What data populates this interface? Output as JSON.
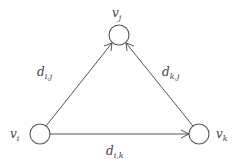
{
  "diagram": {
    "type": "directed-graph",
    "nodes": [
      {
        "id": "vi",
        "main": "v",
        "sub": "i",
        "cx": 40,
        "cy": 134,
        "r": 10,
        "label_x": 10,
        "label_y": 135
      },
      {
        "id": "vj",
        "main": "v",
        "sub": "j",
        "cx": 119,
        "cy": 35,
        "r": 10,
        "label_x": 112,
        "label_y": 15
      },
      {
        "id": "vk",
        "main": "v",
        "sub": "k",
        "cx": 199,
        "cy": 134,
        "r": 10,
        "label_x": 217,
        "label_y": 135
      }
    ],
    "edges": [
      {
        "id": "e_ij",
        "from": "vi",
        "to": "vj",
        "main": "d",
        "sub": "i,j",
        "label_x": 37,
        "label_y": 75
      },
      {
        "id": "e_kj",
        "from": "vk",
        "to": "vj",
        "main": "d",
        "sub": "k,j",
        "label_x": 163,
        "label_y": 75
      },
      {
        "id": "e_ik",
        "from": "vi",
        "to": "vk",
        "main": "d",
        "sub": "i,k",
        "label_x": 105,
        "label_y": 155
      }
    ],
    "colors": {
      "stroke": "#555555",
      "text": "#444444",
      "background": "#ffffff"
    }
  }
}
